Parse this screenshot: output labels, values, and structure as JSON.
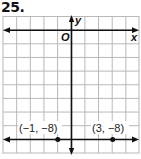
{
  "problem": {
    "number": "25."
  },
  "graph": {
    "x_axis_label": "x",
    "y_axis_label": "y",
    "origin_label": "O",
    "grid": {
      "x_min": -5,
      "x_max": 5,
      "y_min": -9,
      "y_max": 1,
      "step": 1
    },
    "line": {
      "equation": "y = -8",
      "type": "horizontal",
      "y": -8
    },
    "points": [
      {
        "label": "(−1, −8)",
        "x": -1,
        "y": -8
      },
      {
        "label": "(3, −8)",
        "x": 3,
        "y": -8
      }
    ],
    "colors": {
      "grid": "#b8b8b8",
      "axis": "#111111",
      "line": "#111111",
      "point": "#111111"
    }
  }
}
